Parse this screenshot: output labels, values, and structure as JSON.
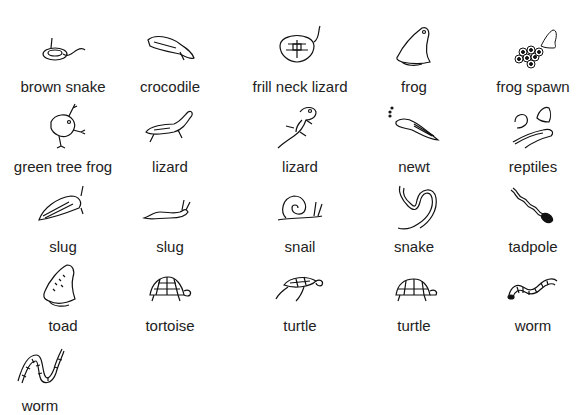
{
  "gallery": {
    "items": [
      {
        "label": "brown snake",
        "icon": "brown-snake-icon"
      },
      {
        "label": "crocodile",
        "icon": "crocodile-icon"
      },
      {
        "label": "frill neck lizard",
        "icon": "frill-neck-lizard-icon"
      },
      {
        "label": "frog",
        "icon": "frog-icon"
      },
      {
        "label": "frog spawn",
        "icon": "frog-spawn-icon"
      },
      {
        "label": "green tree frog",
        "icon": "green-tree-frog-icon"
      },
      {
        "label": "lizard",
        "icon": "lizard-icon"
      },
      {
        "label": "lizard",
        "icon": "lizard-icon"
      },
      {
        "label": "newt",
        "icon": "newt-icon"
      },
      {
        "label": "reptiles",
        "icon": "reptiles-icon"
      },
      {
        "label": "slug",
        "icon": "slug-icon"
      },
      {
        "label": "slug",
        "icon": "slug-icon"
      },
      {
        "label": "snail",
        "icon": "snail-icon"
      },
      {
        "label": "snake",
        "icon": "snake-icon"
      },
      {
        "label": "tadpole",
        "icon": "tadpole-icon"
      },
      {
        "label": "toad",
        "icon": "toad-icon"
      },
      {
        "label": "tortoise",
        "icon": "tortoise-icon"
      },
      {
        "label": "turtle",
        "icon": "turtle-icon"
      },
      {
        "label": "turtle",
        "icon": "turtle-icon"
      },
      {
        "label": "worm",
        "icon": "worm-icon"
      },
      {
        "label": "worm",
        "icon": "worm-icon"
      }
    ]
  }
}
